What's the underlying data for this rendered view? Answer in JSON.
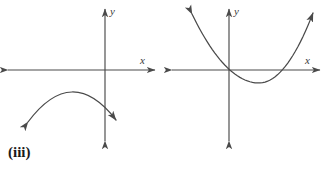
{
  "canvas": {
    "width": 328,
    "height": 172,
    "background_color": "#ffffff",
    "stroke_color": "#4a4a4a",
    "text_color": "#1a1a1a"
  },
  "figures": [
    {
      "id": "iii",
      "caption": "(iii)",
      "axes": {
        "x_label": "x",
        "y_label": "y",
        "origin": {
          "x": 105,
          "y": 70
        }
      },
      "curve": {
        "shape": "parabola",
        "opens": "down",
        "description": "downward-opening arc lying entirely below the x-axis",
        "arrowheads": [
          "down-left",
          "down-right"
        ],
        "vertex": {
          "x": 72,
          "y": 93
        },
        "left_end": {
          "x": 26,
          "y": 124
        },
        "right_end": {
          "x": 118,
          "y": 122
        },
        "x_intercepts": 0
      }
    },
    {
      "id": "iv",
      "caption": "(iv)",
      "axes": {
        "x_label": "x",
        "y_label": "y",
        "origin": {
          "x": 229,
          "y": 70
        }
      },
      "curve": {
        "shape": "parabola",
        "opens": "up",
        "description": "upward-opening parabola with vertex below the x-axis, crossing it twice",
        "arrowheads": [
          "up-left",
          "up-right"
        ],
        "vertex": {
          "x": 259,
          "y": 83
        },
        "left_end": {
          "x": 192,
          "y": 14
        },
        "right_end": {
          "x": 313,
          "y": 13
        },
        "x_intercepts": 2
      }
    }
  ],
  "chart_data": {
    "type": "line",
    "title": "",
    "xlabel": "x",
    "ylabel": "y",
    "panels": [
      {
        "label": "(iii)",
        "type": "line",
        "curve_type": "parabola",
        "opens": "down",
        "x_intercepts": 0,
        "grid": false,
        "legend": "none",
        "axes_shown": [
          "x",
          "y"
        ],
        "x": [
          -5.3,
          -4.0,
          -2.6,
          -1.3,
          0.0,
          1.3,
          2.6
        ],
        "y": [
          -3.6,
          -2.3,
          -1.8,
          -1.9,
          -2.4,
          -3.1,
          -4.0
        ]
      },
      {
        "label": "(iv)",
        "type": "line",
        "curve_type": "parabola",
        "opens": "up",
        "x_intercepts": 2,
        "grid": false,
        "legend": "none",
        "axes_shown": [
          "x",
          "y"
        ],
        "x": [
          -2.3,
          -1.5,
          -0.8,
          0.0,
          0.8,
          1.5,
          2.3,
          3.0,
          3.8,
          4.5,
          5.3,
          6.0,
          6.8,
          7.6,
          8.4
        ],
        "y": [
          5.6,
          3.4,
          1.6,
          0.3,
          -0.6,
          -1.1,
          -1.3,
          -1.1,
          -0.6,
          0.3,
          1.6,
          3.4,
          5.6,
          7.0,
          7.6
        ]
      }
    ]
  }
}
